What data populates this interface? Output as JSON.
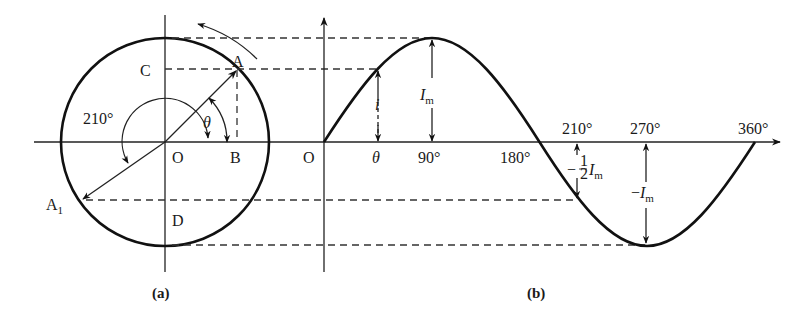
{
  "panel_a": {
    "caption": "(a)",
    "points": {
      "A": "A",
      "A1": "A",
      "A1_sub": "1",
      "B": "B",
      "C": "C",
      "D": "D",
      "O": "O"
    },
    "angles": {
      "theta": "θ",
      "deg210": "210°"
    }
  },
  "panel_b": {
    "caption": "(b)",
    "origin": "O",
    "x_ticks": {
      "theta": "θ",
      "t90": "90°",
      "t180": "180°",
      "t210": "210°",
      "t270": "270°",
      "t360": "360°"
    },
    "annotations": {
      "i": "i",
      "Im": "I",
      "Im_sub": "m",
      "neg": "−",
      "neg_Im": "I",
      "neg_Im_sub": "m",
      "half_num": "1",
      "half_den": "2",
      "half_Im": "I",
      "half_Im_sub": "m"
    }
  },
  "colors": {
    "line": "#111111",
    "dash": "#333333",
    "background": "#ffffff"
  }
}
